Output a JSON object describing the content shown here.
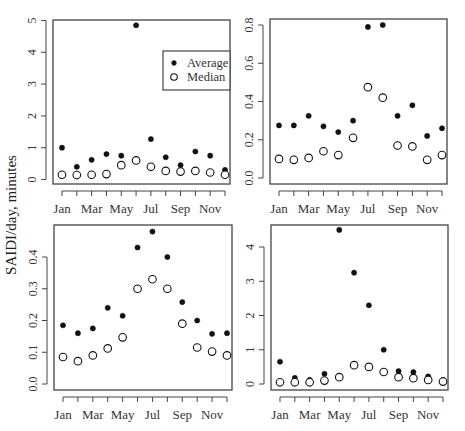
{
  "figure": {
    "shared_ylabel": "SAIDI/day, minutes",
    "legend": {
      "entries": [
        {
          "label": "Average",
          "marker": "filled-circle"
        },
        {
          "label": "Median",
          "marker": "open-circle"
        }
      ]
    },
    "colors": {
      "points": "#111111",
      "frame": "#444444",
      "background": "#ffffff"
    }
  },
  "chart_data": [
    {
      "type": "scatter",
      "panel": "top-left",
      "title": "",
      "xlabel": "",
      "ylabel": "SAIDI/day, minutes",
      "categories": [
        "Jan",
        "Feb",
        "Mar",
        "Apr",
        "May",
        "Jun",
        "Jul",
        "Aug",
        "Sep",
        "Oct",
        "Nov",
        "Dec"
      ],
      "x_tick_labels": [
        "Jan",
        "Mar",
        "May",
        "Jul",
        "Sep",
        "Nov"
      ],
      "y_ticks": [
        0,
        1,
        2,
        3,
        4,
        5
      ],
      "ylim": [
        0,
        5
      ],
      "legend": {
        "position": "upper-right",
        "entries": [
          "Average",
          "Median"
        ]
      },
      "series": [
        {
          "name": "Average",
          "values": [
            1.0,
            0.4,
            0.62,
            0.8,
            0.75,
            4.85,
            1.27,
            0.7,
            0.45,
            0.88,
            0.75,
            0.3
          ]
        },
        {
          "name": "Median",
          "values": [
            0.15,
            0.14,
            0.15,
            0.17,
            0.45,
            0.6,
            0.4,
            0.27,
            0.25,
            0.27,
            0.22,
            0.15
          ]
        }
      ]
    },
    {
      "type": "scatter",
      "panel": "top-right",
      "title": "",
      "xlabel": "",
      "ylabel": "",
      "categories": [
        "Jan",
        "Feb",
        "Mar",
        "Apr",
        "May",
        "Jun",
        "Jul",
        "Aug",
        "Sep",
        "Oct",
        "Nov",
        "Dec"
      ],
      "x_tick_labels": [
        "Jan",
        "Mar",
        "May",
        "Jul",
        "Sep",
        "Nov"
      ],
      "y_ticks": [
        0.0,
        0.2,
        0.4,
        0.6,
        0.8
      ],
      "y_tick_labels": [
        "0.0",
        "0.2",
        "0.4",
        "0.6",
        "0.8"
      ],
      "ylim": [
        0,
        0.8
      ],
      "series": [
        {
          "name": "Average",
          "values": [
            0.275,
            0.275,
            0.325,
            0.27,
            0.24,
            0.3,
            0.79,
            0.8,
            0.325,
            0.38,
            0.22,
            0.26
          ]
        },
        {
          "name": "Median",
          "values": [
            0.1,
            0.095,
            0.105,
            0.14,
            0.12,
            0.21,
            0.475,
            0.42,
            0.17,
            0.165,
            0.095,
            0.12
          ]
        }
      ]
    },
    {
      "type": "scatter",
      "panel": "bottom-left",
      "title": "",
      "xlabel": "",
      "ylabel": "SAIDI/day, minutes",
      "categories": [
        "Jan",
        "Feb",
        "Mar",
        "Apr",
        "May",
        "Jun",
        "Jul",
        "Aug",
        "Sep",
        "Oct",
        "Nov",
        "Dec"
      ],
      "x_tick_labels": [
        "Jan",
        "Mar",
        "May",
        "Jul",
        "Sep",
        "Nov"
      ],
      "y_ticks": [
        0.0,
        0.1,
        0.2,
        0.3,
        0.4
      ],
      "y_tick_labels": [
        "0.0",
        "0.1",
        "0.2",
        "0.3",
        "0.4"
      ],
      "ylim": [
        0,
        0.48
      ],
      "series": [
        {
          "name": "Average",
          "values": [
            0.185,
            0.16,
            0.175,
            0.24,
            0.215,
            0.43,
            0.48,
            0.4,
            0.258,
            0.2,
            0.158,
            0.16
          ]
        },
        {
          "name": "Median",
          "values": [
            0.085,
            0.072,
            0.09,
            0.112,
            0.147,
            0.3,
            0.33,
            0.3,
            0.19,
            0.115,
            0.102,
            0.09
          ]
        }
      ]
    },
    {
      "type": "scatter",
      "panel": "bottom-right",
      "title": "",
      "xlabel": "",
      "ylabel": "",
      "categories": [
        "Jan",
        "Feb",
        "Mar",
        "Apr",
        "May",
        "Jun",
        "Jul",
        "Aug",
        "Sep",
        "Oct",
        "Nov",
        "Dec"
      ],
      "x_tick_labels": [
        "Jan",
        "Mar",
        "May",
        "Jul",
        "Sep",
        "Nov"
      ],
      "y_ticks": [
        0,
        1,
        2,
        3,
        4
      ],
      "ylim": [
        0,
        4.5
      ],
      "series": [
        {
          "name": "Average",
          "values": [
            0.65,
            0.18,
            0.12,
            0.3,
            4.5,
            3.25,
            2.3,
            1.0,
            0.38,
            0.35,
            0.22,
            0.12
          ]
        },
        {
          "name": "Median",
          "values": [
            0.05,
            0.05,
            0.05,
            0.1,
            0.2,
            0.55,
            0.5,
            0.35,
            0.2,
            0.17,
            0.12,
            0.07
          ]
        }
      ]
    }
  ]
}
